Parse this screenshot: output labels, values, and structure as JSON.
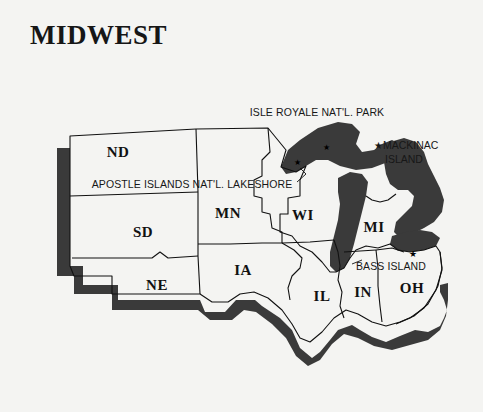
{
  "map": {
    "title": "MIDWEST",
    "background_color": "#f4f4f2",
    "land_fill": "#f7f7f5",
    "water_fill": "#3a3a3a",
    "shadow_fill": "#3a3a3a",
    "outline_color": "#111111"
  },
  "states": [
    {
      "code": "ND",
      "x": 118,
      "y": 152
    },
    {
      "code": "SD",
      "x": 143,
      "y": 232
    },
    {
      "code": "NE",
      "x": 157,
      "y": 285
    },
    {
      "code": "MN",
      "x": 228,
      "y": 213
    },
    {
      "code": "IA",
      "x": 243,
      "y": 270
    },
    {
      "code": "WI",
      "x": 303,
      "y": 215
    },
    {
      "code": "IL",
      "x": 322,
      "y": 296
    },
    {
      "code": "IN",
      "x": 363,
      "y": 292
    },
    {
      "code": "MI",
      "x": 374,
      "y": 227
    },
    {
      "code": "OH",
      "x": 412,
      "y": 288
    }
  ],
  "annotations": [
    {
      "id": "isle-royale",
      "text": "ISLE ROYALE NAT'L. PARK",
      "x": 317,
      "y": 112,
      "style": "centered"
    },
    {
      "id": "apostle-islands",
      "text": "APOSTLE ISLANDS NAT'L. LAKESHORE",
      "x": 192,
      "y": 184,
      "style": "centered"
    },
    {
      "id": "bass-island",
      "text": "BASS ISLAND",
      "x": 391,
      "y": 266,
      "style": "centered"
    }
  ],
  "legend": {
    "id": "mackinac-island",
    "star": "★",
    "line1": "MACKINAC",
    "line2": "ISLAND",
    "x": 374,
    "y": 138
  },
  "markers": [
    {
      "id": "isle-royale-marker",
      "glyph": "★",
      "x": 323,
      "y": 143
    },
    {
      "id": "apostle-islands-marker",
      "glyph": "★",
      "x": 294,
      "y": 158
    },
    {
      "id": "bass-island-marker",
      "glyph": "★",
      "x": 409,
      "y": 249
    }
  ]
}
